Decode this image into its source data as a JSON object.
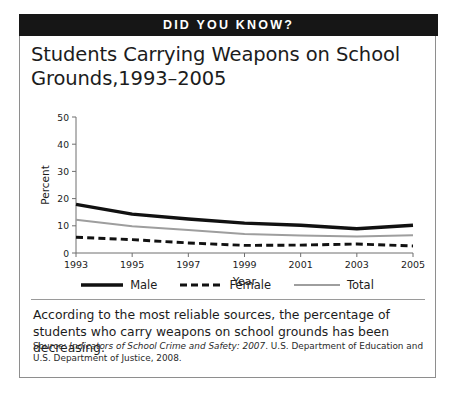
{
  "banner": {
    "title": "DID YOU KNOW?"
  },
  "headline": "Students Carrying Weapons on School Grounds,1993–2005",
  "chart_data": {
    "type": "line",
    "xlabel": "Year",
    "ylabel": "Percent",
    "x": [
      1993,
      1995,
      1997,
      1999,
      2001,
      2003,
      2005
    ],
    "xticklabels": [
      "1993",
      "1995",
      "1997",
      "1999",
      "2001",
      "2003",
      "2005"
    ],
    "yticklabels": [
      "0",
      "10",
      "20",
      "30",
      "40",
      "50"
    ],
    "ylim": [
      0,
      50
    ],
    "xlim": [
      1993,
      2005
    ],
    "ytick_step": 10,
    "grid": false,
    "legend_position": "bottom",
    "series": [
      {
        "name": "Male",
        "style": "solid-thick",
        "color": "#111111",
        "values": [
          17.9,
          14.3,
          12.5,
          11.0,
          10.2,
          8.9,
          10.2
        ]
      },
      {
        "name": "Female",
        "style": "dashed",
        "color": "#111111",
        "values": [
          5.8,
          4.9,
          3.7,
          2.8,
          2.9,
          3.3,
          2.6
        ]
      },
      {
        "name": "Total",
        "style": "solid-thin",
        "color": "#9e9e9e",
        "values": [
          12.2,
          9.8,
          8.5,
          7.0,
          6.4,
          6.1,
          6.5
        ]
      }
    ]
  },
  "legend": [
    {
      "label": "Male",
      "swatch": "solid-thick-black-line"
    },
    {
      "label": "Female",
      "swatch": "dashed-black-line"
    },
    {
      "label": "Total",
      "swatch": "solid-thin-gray-line"
    }
  ],
  "body_text": "According to the most reliable sources, the percentage of students who carry weapons on school grounds has been decreasing.",
  "source": {
    "prefix": "Source: ",
    "italic_title": "Indicators of School Crime and Safety: 2007",
    "suffix": ". U.S. Department of Education and U.S. Department of Justice, 2008."
  }
}
